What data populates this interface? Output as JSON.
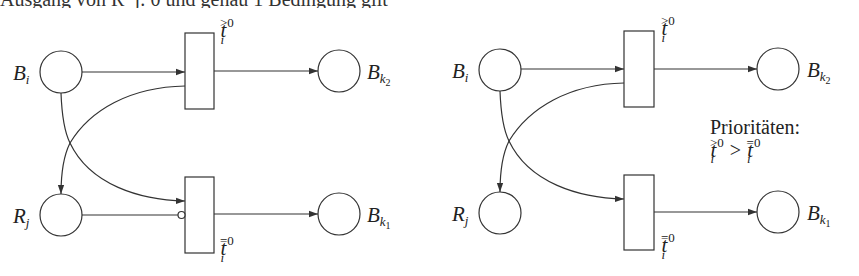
{
  "top_line_clipped": "Ausgang von R_j: 0 und genau 1 Bedingung gilt",
  "diagrams": [
    {
      "id": "left",
      "variant": "inhibitor-arc",
      "places": {
        "Bi": {
          "label": "B",
          "sub": "i"
        },
        "Rj": {
          "label": "R",
          "sub": "j"
        },
        "Bk2": {
          "label": "B",
          "sub": "k",
          "subsub": "2"
        },
        "Bk1": {
          "label": "B",
          "sub": "k",
          "subsub": "1"
        }
      },
      "transitions": {
        "upper": {
          "label": "t",
          "sub": "i",
          "sup": ">0"
        },
        "lower": {
          "label": "t",
          "sub": "i",
          "sup": "=0"
        }
      }
    },
    {
      "id": "right",
      "variant": "priorities",
      "places": {
        "Bi": {
          "label": "B",
          "sub": "i"
        },
        "Rj": {
          "label": "R",
          "sub": "j"
        },
        "Bk2": {
          "label": "B",
          "sub": "k",
          "subsub": "2"
        },
        "Bk1": {
          "label": "B",
          "sub": "k",
          "subsub": "1"
        }
      },
      "transitions": {
        "upper": {
          "label": "t",
          "sub": "i",
          "sup": ">0"
        },
        "lower": {
          "label": "t",
          "sub": "i",
          "sup": "=0"
        }
      },
      "note": {
        "title": "Prioritäten:",
        "lhs": {
          "label": "t",
          "sub": "i",
          "sup": ">0"
        },
        "op": ">",
        "rhs": {
          "label": "t",
          "sub": "i",
          "sup": "=0"
        }
      }
    }
  ],
  "colors": {
    "stroke": "#333333",
    "background": "#ffffff"
  }
}
